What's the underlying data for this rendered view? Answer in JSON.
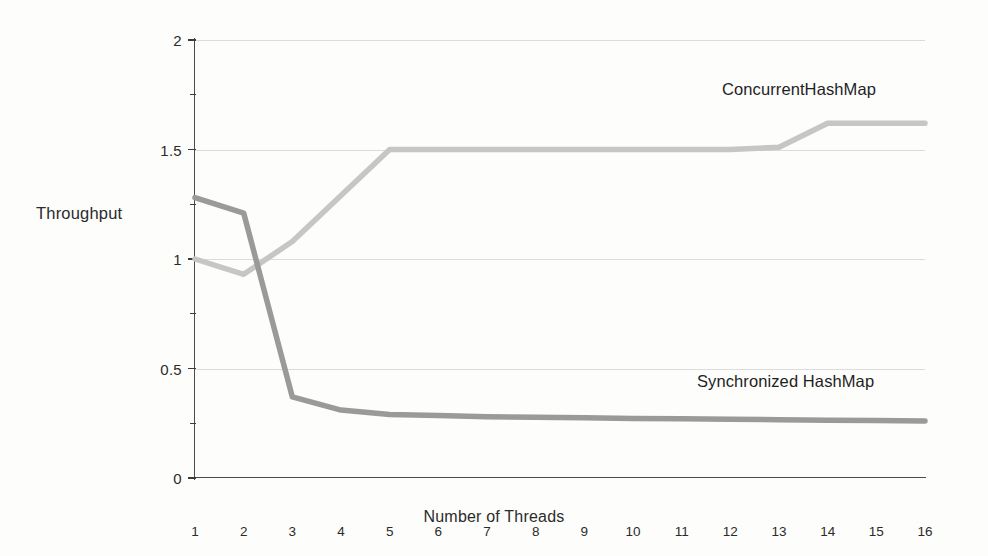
{
  "chart_data": {
    "type": "line",
    "title": "",
    "xlabel": "Number of Threads",
    "ylabel": "Throughput",
    "xlim": [
      1,
      16
    ],
    "ylim": [
      0,
      2
    ],
    "grid": true,
    "legend_position": "inline-annotation",
    "x": [
      1,
      2,
      3,
      4,
      5,
      6,
      7,
      8,
      9,
      10,
      11,
      12,
      13,
      14,
      15,
      16
    ],
    "xticks": [
      "1",
      "2",
      "3",
      "4",
      "5",
      "6",
      "7",
      "8",
      "9",
      "10",
      "11",
      "12",
      "13",
      "14",
      "15",
      "16"
    ],
    "yticks": [
      "0",
      "0.5",
      "1",
      "1.5",
      "2"
    ],
    "ytick_values": [
      0,
      0.5,
      1,
      1.5,
      2
    ],
    "yminor_values": [
      0.25,
      0.75,
      1.25,
      1.75
    ],
    "series": [
      {
        "name": "ConcurrentHashMap",
        "color": "#c6c6c6",
        "values": [
          1.0,
          0.93,
          1.08,
          1.29,
          1.5,
          1.5,
          1.5,
          1.5,
          1.5,
          1.5,
          1.5,
          1.5,
          1.51,
          1.62,
          1.62,
          1.62
        ]
      },
      {
        "name": "Synchronized HashMap",
        "color": "#9a9a9a",
        "values": [
          1.28,
          1.21,
          0.37,
          0.31,
          0.29,
          0.285,
          0.28,
          0.277,
          0.275,
          0.272,
          0.27,
          0.268,
          0.266,
          0.264,
          0.262,
          0.26
        ]
      }
    ],
    "annotations": [
      {
        "text": "ConcurrentHashMap",
        "x": 13.8,
        "y": 1.79
      },
      {
        "text": "Synchronized HashMap",
        "x": 13.3,
        "y": 0.45
      }
    ]
  },
  "axis": {
    "y_title": "Throughput",
    "x_title": "Number of Threads"
  },
  "colors": {
    "background": "#fdfdfc",
    "axis": "#4a4a4a",
    "grid": "#dcdcdc",
    "series_concurrent": "#c6c6c6",
    "series_synchronized": "#9a9a9a",
    "text": "#2b2b2b"
  }
}
